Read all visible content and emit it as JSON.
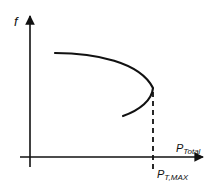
{
  "diagram": {
    "y_axis_label": "f",
    "x_axis_label_main": "P",
    "x_axis_label_sub": "Total",
    "marker_label_main": "P",
    "marker_label_sub": "T,MAX",
    "colors": {
      "line": "#111111",
      "background": "#ffffff"
    },
    "curve": {
      "description": "nose curve: frequency vs total power, upper branch flat then bending down to a maximum power point, lower branch returning left",
      "start": [
        55,
        53
      ],
      "vertex": [
        153,
        90
      ],
      "end": [
        123,
        116
      ]
    },
    "marker": {
      "style": "dashed",
      "x": 153
    }
  }
}
